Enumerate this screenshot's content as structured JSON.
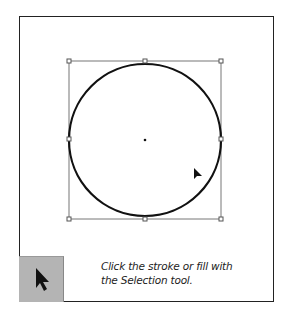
{
  "illustration": {
    "shape": "circle",
    "selected": true,
    "bounding_box": {
      "x": 69,
      "y": 61,
      "width": 152,
      "height": 158
    },
    "handles": [
      "top-left",
      "top-center",
      "top-right",
      "middle-left",
      "middle-right",
      "bottom-left",
      "bottom-center",
      "bottom-right"
    ],
    "center_point": {
      "x": 145,
      "y": 140
    },
    "stroke_color": "#111111"
  },
  "tool": {
    "name": "Selection tool",
    "icon": "arrow-pointer-icon",
    "background": "#b4b4b4"
  },
  "caption": {
    "line1": "Click the stroke or fill with",
    "line2": "the Selection tool."
  }
}
